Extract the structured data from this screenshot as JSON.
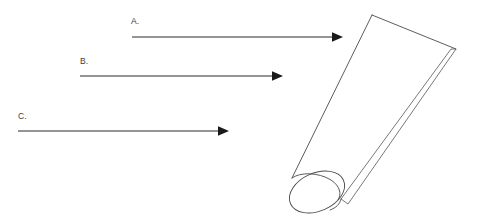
{
  "figure": {
    "background_color": "#ffffff",
    "line_color": "#2b2b2b",
    "outline_color": "#4a4a4a",
    "text_color": "#3a3a3a",
    "width": 479,
    "height": 222
  },
  "callouts": [
    {
      "id": "a",
      "label": "A.",
      "label_x": 131,
      "label_y": 24,
      "line_start_x": 132,
      "line_start_y": 37,
      "line_end_x": 334,
      "line_end_y": 37,
      "arrow_tip_x": 343,
      "arrow_tip_y": 37
    },
    {
      "id": "b",
      "label": "B.",
      "label_x": 80,
      "label_y": 64,
      "line_start_x": 80,
      "line_start_y": 76,
      "line_end_x": 274,
      "line_end_y": 76,
      "arrow_tip_x": 283,
      "arrow_tip_y": 76
    },
    {
      "id": "c",
      "label": "C.",
      "label_x": 18,
      "label_y": 119,
      "line_start_x": 18,
      "line_start_y": 131,
      "line_end_x": 220,
      "line_end_y": 131,
      "arrow_tip_x": 229,
      "arrow_tip_y": 131
    }
  ],
  "object": {
    "name": "tube",
    "description": "Elongated tapered tube tilted diagonally, crimped flat seam at upper right, elliptical open end at lower left",
    "crimp_top_corner": {
      "x": 372,
      "y": 15
    },
    "crimp_right_corner": {
      "x": 456,
      "y": 49
    },
    "ellipse_center": {
      "x": 317,
      "y": 192
    },
    "ellipse_radius_x": 29,
    "ellipse_radius_y": 19,
    "ellipse_rotation_deg": -24
  }
}
